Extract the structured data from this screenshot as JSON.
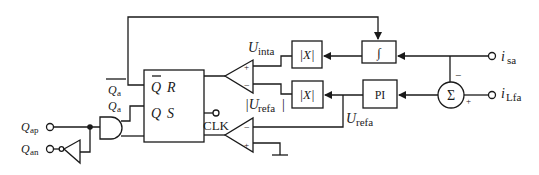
{
  "diagram": {
    "type": "block-diagram",
    "colors": {
      "line": "#1a1a1a",
      "background": "#ffffff"
    },
    "inputs": {
      "q_ap": {
        "main": "Q",
        "sub": "ap"
      },
      "q_an": {
        "main": "Q",
        "sub": "an"
      },
      "i_sa": {
        "main": "i",
        "sub": "sa"
      },
      "i_lfa": {
        "main": "i",
        "sub": "Lfa"
      }
    },
    "signals": {
      "q_a_bar": {
        "main": "Q",
        "sub": "a"
      },
      "q_a": {
        "main": "Q",
        "sub": "a"
      },
      "u_inta": {
        "main": "U",
        "sub": "inta"
      },
      "u_refa_abs": {
        "main": "|U",
        "sub": "refa",
        "close": "|"
      },
      "u_refa": {
        "main": "U",
        "sub": "refa"
      },
      "clk": "CLK"
    },
    "blocks": {
      "abs_top": "|X|",
      "abs_bottom": "|X|",
      "integrator": "∫",
      "pi": "PI",
      "sum": "Σ",
      "flipflop": {
        "q_bar": "Q",
        "r": "R",
        "q": "Q",
        "s": "S"
      }
    },
    "sum_signs": {
      "top": "−",
      "bottom": "+"
    },
    "comparator_signs": {
      "plus": "+",
      "minus": "−"
    }
  }
}
